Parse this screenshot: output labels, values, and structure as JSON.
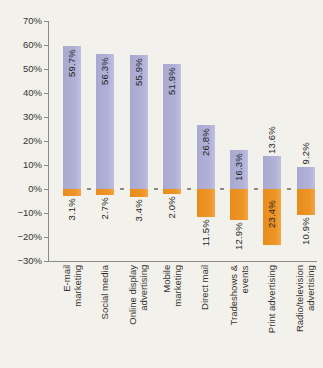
{
  "figure": {
    "background": "#f2f1ec",
    "title": ""
  },
  "chart_data": {
    "type": "bar",
    "title": "",
    "xlabel": "",
    "ylabel": "",
    "ylim": [
      -30,
      70
    ],
    "ytick_step": 10,
    "grid": false,
    "legend": "none",
    "bar_label_rotation": 90,
    "category_label_rotation": 90,
    "categories": [
      "E-mail\nmarketing",
      "Social media",
      "Online display\nadvertising",
      "Mobile\nmarketing",
      "Direct mail",
      "Tradeshows &\nevents",
      "Print advertising",
      "Radio/television\nadvertising"
    ],
    "series": [
      {
        "name": "increase",
        "color": "#b2b1d7",
        "values": [
          59.7,
          56.3,
          55.9,
          51.9,
          26.8,
          16.3,
          13.6,
          9.2
        ],
        "labels": [
          "59.7%",
          "56.3%",
          "55.9%",
          "51.9%",
          "26.8%",
          "16.3%",
          "13.6%",
          "9.2%"
        ]
      },
      {
        "name": "decrease",
        "color": "#ee9426",
        "values": [
          -3.1,
          -2.7,
          -3.4,
          -2.0,
          -11.5,
          -12.9,
          -23.4,
          -10.9
        ],
        "labels": [
          "3.1%",
          "2.7%",
          "3.4%",
          "2.0%",
          "11.5%",
          "12.9%",
          "23.4%",
          "10.9%"
        ]
      }
    ],
    "ytick_labels": [
      "70%",
      "60%",
      "50%",
      "40%",
      "30%",
      "20%",
      "10%",
      "0%",
      "−10%",
      "−20%",
      "−30%"
    ],
    "axis_color": "#8b8b85",
    "text_color": "#36352f",
    "value_text_color": "#1f1f1f"
  }
}
